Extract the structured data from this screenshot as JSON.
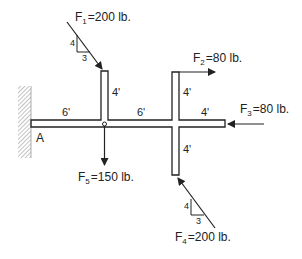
{
  "diagram": {
    "type": "statics-frame-free-body",
    "support": {
      "label": "A",
      "kind": "fixed-wall"
    },
    "dimensions": {
      "left_span": "6'",
      "left_post_height": "4'",
      "middle_span": "6'",
      "right_post_up": "4'",
      "right_arm": "4'",
      "right_post_down": "4'"
    },
    "forces": {
      "f1": {
        "name": "F",
        "sub": "1",
        "value": "=200 lb.",
        "slope_rise": "4",
        "slope_run": "3"
      },
      "f2": {
        "name": "F",
        "sub": "2",
        "value": "=80 lb."
      },
      "f3": {
        "name": "F",
        "sub": "3",
        "value": "=80 lb."
      },
      "f4": {
        "name": "F",
        "sub": "4",
        "value": "=200 lb.",
        "slope_rise": "4",
        "slope_run": "3"
      },
      "f5": {
        "name": "F",
        "sub": "5",
        "value": "=150 lb."
      }
    },
    "colors": {
      "line": "#222222",
      "hatch": "#888888",
      "background": "#ffffff"
    }
  }
}
